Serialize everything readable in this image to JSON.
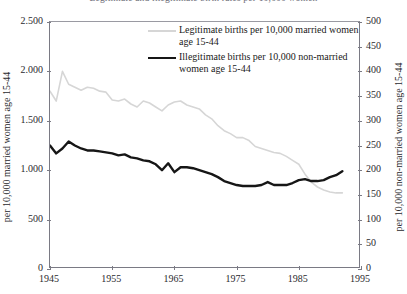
{
  "figure": {
    "title_cutoff": "Legitimate and illegitimate birth rates per 10,000 women"
  },
  "legend": {
    "position": "inside-top-center",
    "entries": [
      {
        "name": "legitimate",
        "label": "Legitimate births per 10,000 married women age 15-44",
        "color": "#d6d6d6",
        "style": "thin"
      },
      {
        "name": "illegitimate",
        "label": "Illegitimate births per 10,000 non-married women age 15-44",
        "color": "#161616",
        "style": "heavy"
      }
    ]
  },
  "axes": {
    "left": {
      "title": "per 10,000 married women age 15-44",
      "ticks": [
        "0",
        "500",
        "1.000",
        "1.500",
        "2.000",
        "2.500"
      ],
      "min": 0,
      "max": 2500,
      "step": 500
    },
    "right": {
      "title": "per 10,000 non-married women age 15-44",
      "ticks": [
        "0",
        "50",
        "100",
        "150",
        "200",
        "250",
        "300",
        "350",
        "400",
        "450",
        "500"
      ],
      "min": 0,
      "max": 500,
      "step": 50
    },
    "bottom": {
      "ticks": [
        "1945",
        "1955",
        "1965",
        "1975",
        "1985",
        "1995"
      ],
      "min": 1945,
      "max": 1995,
      "step": 10
    }
  },
  "chart_data": {
    "type": "line",
    "title": "Legitimate and illegitimate birth rates per 10,000 women",
    "xlabel": "",
    "ylabel": "per 10,000 married women age 15-44",
    "y2label": "per 10,000 non-married women age 15-44",
    "xlim": [
      1945,
      1995
    ],
    "ylim": [
      0,
      2500
    ],
    "y2lim": [
      0,
      500
    ],
    "grid": false,
    "legend_position": "inside-top-center",
    "x": [
      1945,
      1946,
      1947,
      1948,
      1949,
      1950,
      1951,
      1952,
      1953,
      1954,
      1955,
      1956,
      1957,
      1958,
      1959,
      1960,
      1961,
      1962,
      1963,
      1964,
      1965,
      1966,
      1967,
      1968,
      1969,
      1970,
      1971,
      1972,
      1973,
      1974,
      1975,
      1976,
      1977,
      1978,
      1979,
      1980,
      1981,
      1982,
      1983,
      1984,
      1985,
      1986,
      1987,
      1988,
      1989,
      1990,
      1991,
      1992
    ],
    "series": [
      {
        "name": "Legitimate births per 10,000 married women age 15-44",
        "axis": "left",
        "color": "#d6d6d6",
        "values": [
          1800,
          1700,
          2000,
          1870,
          1840,
          1810,
          1840,
          1830,
          1800,
          1790,
          1710,
          1700,
          1720,
          1670,
          1640,
          1700,
          1680,
          1640,
          1600,
          1660,
          1690,
          1700,
          1660,
          1640,
          1620,
          1560,
          1520,
          1450,
          1400,
          1370,
          1330,
          1330,
          1300,
          1240,
          1220,
          1200,
          1180,
          1170,
          1140,
          1100,
          1060,
          960,
          880,
          830,
          800,
          780,
          770,
          770
        ]
      },
      {
        "name": "Illegitimate births per 10,000 non-married women age 15-44",
        "axis": "right",
        "color": "#161616",
        "values": [
          250,
          234,
          244,
          258,
          250,
          244,
          240,
          240,
          238,
          236,
          234,
          230,
          232,
          226,
          224,
          220,
          218,
          212,
          200,
          214,
          196,
          206,
          206,
          204,
          200,
          196,
          192,
          186,
          178,
          174,
          170,
          168,
          168,
          168,
          170,
          176,
          170,
          170,
          170,
          174,
          180,
          182,
          178,
          178,
          180,
          186,
          190,
          198
        ]
      }
    ]
  }
}
